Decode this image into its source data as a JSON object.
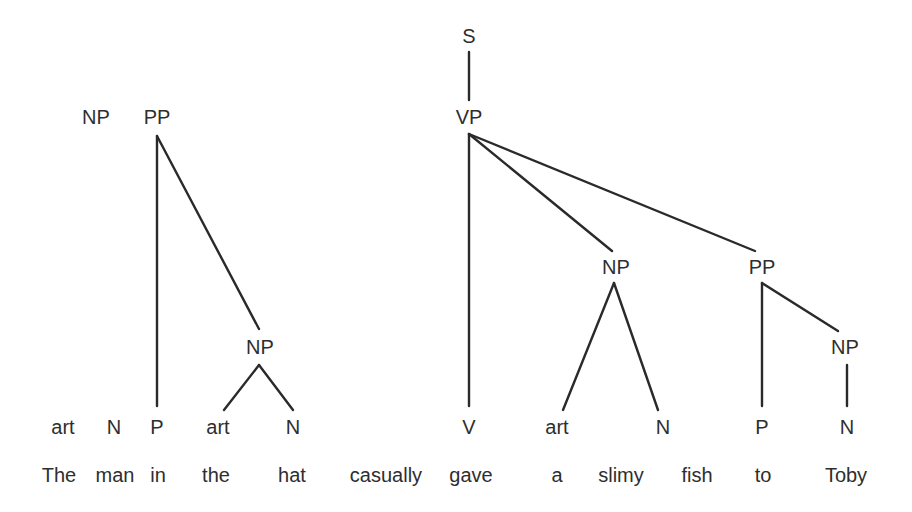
{
  "diagram": {
    "type": "syntax-tree",
    "colors": {
      "text": "#2e2e2e",
      "line": "#2a2a2a",
      "background": "#ffffff"
    },
    "nodes": [
      {
        "id": "s",
        "label": "S",
        "x": 469,
        "y": 36
      },
      {
        "id": "vp",
        "label": "VP",
        "x": 469,
        "y": 117
      },
      {
        "id": "np_top",
        "label": "NP",
        "x": 96,
        "y": 117
      },
      {
        "id": "pp_left",
        "label": "PP",
        "x": 157,
        "y": 117
      },
      {
        "id": "np_hat",
        "label": "NP",
        "x": 260,
        "y": 347
      },
      {
        "id": "np_obj",
        "label": "NP",
        "x": 616,
        "y": 267
      },
      {
        "id": "pp_to",
        "label": "PP",
        "x": 762,
        "y": 267
      },
      {
        "id": "np_toby",
        "label": "NP",
        "x": 845,
        "y": 347
      },
      {
        "id": "art1",
        "label": "art",
        "x": 63,
        "y": 427
      },
      {
        "id": "n1",
        "label": "N",
        "x": 114,
        "y": 427
      },
      {
        "id": "p1",
        "label": "P",
        "x": 157,
        "y": 427
      },
      {
        "id": "art2",
        "label": "art",
        "x": 218,
        "y": 427
      },
      {
        "id": "n2",
        "label": "N",
        "x": 293,
        "y": 427
      },
      {
        "id": "v",
        "label": "V",
        "x": 469,
        "y": 427
      },
      {
        "id": "art3",
        "label": "art",
        "x": 557,
        "y": 427
      },
      {
        "id": "n3",
        "label": "N",
        "x": 663,
        "y": 427
      },
      {
        "id": "p2",
        "label": "P",
        "x": 762,
        "y": 427
      },
      {
        "id": "n4",
        "label": "N",
        "x": 847,
        "y": 427
      }
    ],
    "edges": [
      {
        "from": "s",
        "to": "vp",
        "x1": 469,
        "y1": 52,
        "x2": 469,
        "y2": 100
      },
      {
        "from": "pp_left",
        "to": "p1",
        "x1": 157,
        "y1": 136,
        "x2": 157,
        "y2": 406
      },
      {
        "from": "pp_left",
        "to": "np_hat",
        "x1": 157,
        "y1": 136,
        "x2": 259,
        "y2": 329
      },
      {
        "from": "np_hat",
        "to": "art2",
        "x1": 259,
        "y1": 365,
        "x2": 224,
        "y2": 410
      },
      {
        "from": "np_hat",
        "to": "n2",
        "x1": 259,
        "y1": 365,
        "x2": 293,
        "y2": 410
      },
      {
        "from": "vp",
        "to": "v",
        "x1": 469,
        "y1": 134,
        "x2": 469,
        "y2": 406
      },
      {
        "from": "vp",
        "to": "np_obj",
        "x1": 469,
        "y1": 134,
        "x2": 612,
        "y2": 251
      },
      {
        "from": "vp",
        "to": "pp_to",
        "x1": 469,
        "y1": 134,
        "x2": 755,
        "y2": 251
      },
      {
        "from": "np_obj",
        "to": "art3",
        "x1": 614,
        "y1": 283,
        "x2": 563,
        "y2": 410
      },
      {
        "from": "np_obj",
        "to": "n3",
        "x1": 614,
        "y1": 283,
        "x2": 658,
        "y2": 410
      },
      {
        "from": "pp_to",
        "to": "p2",
        "x1": 762,
        "y1": 283,
        "x2": 762,
        "y2": 406
      },
      {
        "from": "pp_to",
        "to": "np_toby",
        "x1": 762,
        "y1": 283,
        "x2": 838,
        "y2": 331
      },
      {
        "from": "np_toby",
        "to": "n4",
        "x1": 847,
        "y1": 365,
        "x2": 847,
        "y2": 406
      }
    ],
    "words": [
      {
        "text": "The",
        "x": 59,
        "y": 475
      },
      {
        "text": "man",
        "x": 115,
        "y": 475
      },
      {
        "text": "in",
        "x": 158,
        "y": 475
      },
      {
        "text": "the",
        "x": 216,
        "y": 475
      },
      {
        "text": "hat",
        "x": 292,
        "y": 475
      },
      {
        "text": "casually",
        "x": 386,
        "y": 475
      },
      {
        "text": "gave",
        "x": 471,
        "y": 475
      },
      {
        "text": "a",
        "x": 557,
        "y": 475
      },
      {
        "text": "slimy",
        "x": 621,
        "y": 475
      },
      {
        "text": "fish",
        "x": 697,
        "y": 475
      },
      {
        "text": "to",
        "x": 763,
        "y": 475
      },
      {
        "text": "Toby",
        "x": 846,
        "y": 475
      }
    ]
  }
}
